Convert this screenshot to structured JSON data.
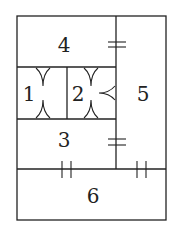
{
  "diagram": {
    "type": "rectangle-partition",
    "regions": [
      {
        "id": "region-1",
        "label": "1"
      },
      {
        "id": "region-2",
        "label": "2"
      },
      {
        "id": "region-3",
        "label": "3"
      },
      {
        "id": "region-4",
        "label": "4"
      },
      {
        "id": "region-5",
        "label": "5"
      },
      {
        "id": "region-6",
        "label": "6"
      }
    ],
    "markings": {
      "equal_double_tick_horizontal": "segments between 4|5 and 3|5 marked equal (double horizontal ticks)",
      "equal_double_tick_vertical": "segments on top edge of 6 marked equal (double vertical ticks)",
      "arrow_marks": "angle marks (V shapes) on edges of regions 1 and 2"
    }
  }
}
